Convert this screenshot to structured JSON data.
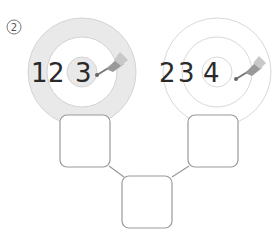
{
  "label": "②",
  "targets": [
    {
      "name": "left-target",
      "numbers": [
        "1",
        "2",
        "3"
      ],
      "filled": true
    },
    {
      "name": "right-target",
      "numbers": [
        "2",
        "3",
        "4"
      ],
      "filled": false
    }
  ],
  "boxes": [
    {
      "name": "left-answer-box",
      "value": ""
    },
    {
      "name": "right-answer-box",
      "value": ""
    },
    {
      "name": "bottom-answer-box",
      "value": ""
    }
  ],
  "colors": {
    "ring_fill": "#e8e8e8",
    "ring_stroke": "#cfcfcf",
    "box_stroke": "#9a9a9a",
    "text": "#2a2a2a"
  }
}
